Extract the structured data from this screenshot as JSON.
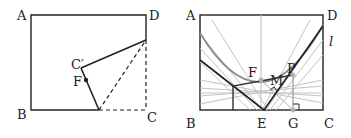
{
  "figure_left": {
    "labels": {
      "A": "A",
      "B": "B",
      "C": "C",
      "D": "D",
      "C_prime": "C′",
      "F": "F"
    }
  },
  "figure_right": {
    "labels": {
      "A": "A",
      "B": "B",
      "C": "C",
      "D": "D",
      "E": "E",
      "F": "F",
      "G": "G",
      "M": "M",
      "P": "P",
      "l": "l"
    }
  },
  "colors": {
    "line": "#222222",
    "gray": "#9a9a9a",
    "light": "#c8c8c8"
  }
}
